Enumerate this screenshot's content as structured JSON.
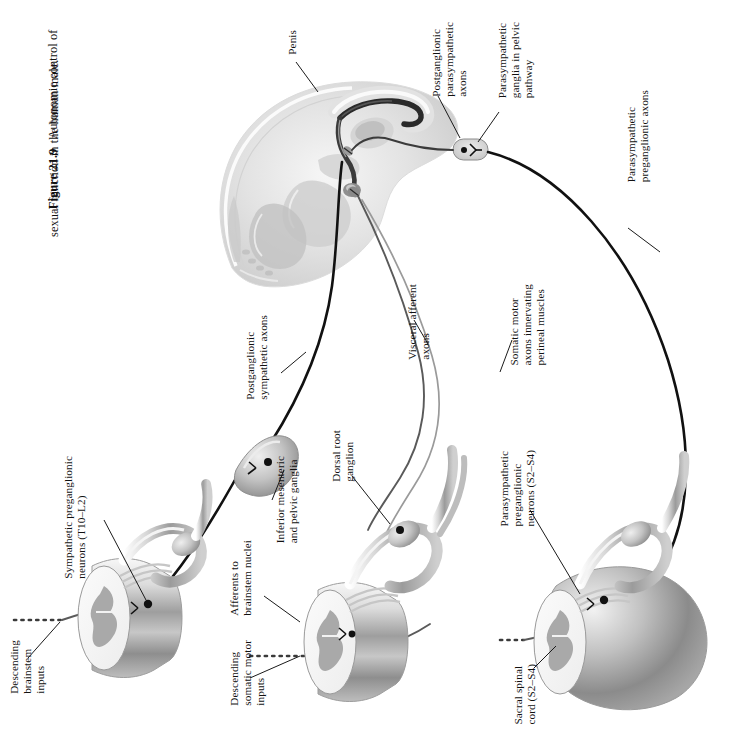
{
  "figure": {
    "number": "Figure 21.9",
    "caption_line1": "Autonomic control of",
    "caption_line2": "sexual function in the human male.",
    "caption_full": "Figure 21.9  Autonomic control of sexual function in the human male."
  },
  "labels": {
    "penis": "Penis",
    "postganglionic_parasympathetic_axons": "Postganglionic\nparasympathetic\naxons",
    "parasympathetic_ganglia_pelvic": "Parasympathetic\nganglia in pelvic\npathway",
    "parasympathetic_preganglionic_axons": "Parasympathetic\npreganglionic axons",
    "postganglionic_sympathetic_axons": "Postganglionic\nsympathetic axons",
    "visceral_afferent_axons": "Visceral afferent\naxons",
    "somatic_motor_axons": "Somatic motor\naxons innervating\nperineal muscles",
    "sympathetic_preganglionic_neurons": "Sympathetic preganglionic\nneurons (T10–L2)",
    "descending_brainstem_inputs": "Descending\nbrainstem\ninputs",
    "inferior_mesenteric_and_pelvic_ganglia": "Inferior mesenteric\nand pelvic ganglia",
    "afferents_to_brainstem_nuclei": "Afferents to\nbrainstem nuclei",
    "descending_somatic_motor_inputs": "Descending\nsomatic motor\ninputs",
    "dorsal_root_ganglion": "Dorsal root\nganglion",
    "parasympathetic_preganglionic_neurons": "Parasympathetic\npreganglionic\nneurons (S2–S4)",
    "sacral_spinal_cord": "Sacral spinal\ncord (S2–S4)"
  },
  "colors": {
    "background": "#ffffff",
    "text": "#111111",
    "nerve_dark": "#111111",
    "nerve_light": "#9a9a9a",
    "tissue_light": "#e9e9e9",
    "tissue_mid": "#c9c9c9",
    "tissue_dark": "#9d9d9d",
    "grey_matter": "#a9a9a9",
    "white_matter": "#f2f2f2"
  },
  "diagram": {
    "type": "anatomical-schematic",
    "orientation": "rotated-90",
    "regions": [
      {
        "name": "pelvic-sagittal-section",
        "description": "Mid-sagittal section of male pelvis showing penis, bladder, prostate and rectum"
      },
      {
        "name": "thoracolumbar-cord-segment",
        "description": "Spinal cord segment T10-L2 with sympathetic preganglionic neurons"
      },
      {
        "name": "mid-cord-segment",
        "description": "Spinal cord segment with dorsal root ganglion and afferents"
      },
      {
        "name": "sacral-cord-segment",
        "description": "Sacral spinal cord S2-S4 with conus medullaris"
      }
    ],
    "ganglia": [
      {
        "name": "pelvic-ganglion",
        "label_ref": "parasympathetic_ganglia_pelvic"
      },
      {
        "name": "inferior-mesenteric-ganglion",
        "label_ref": "inferior_mesenteric_and_pelvic_ganglia"
      },
      {
        "name": "dorsal-root-ganglion",
        "label_ref": "dorsal_root_ganglion"
      }
    ]
  }
}
